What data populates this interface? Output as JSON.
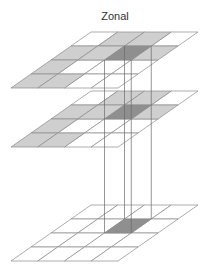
{
  "title": "Zonal",
  "colors": {
    "white": "#ffffff",
    "gray": "#cfcfcf",
    "dark": "#8f8f8f",
    "grid_line": "#8a8a8a",
    "connector_line": "#6a6a6a"
  },
  "geometry": {
    "cols": 4,
    "rows": 4,
    "col_width": 26.75,
    "row_height": 14,
    "row_shear": -20
  },
  "layers": [
    {
      "name": "input-layer-top",
      "origin": [
        91,
        32
      ],
      "cells": [
        [
          "white",
          "gray",
          "gray",
          "white"
        ],
        [
          "gray",
          "gray",
          "dark",
          "gray"
        ],
        [
          "gray",
          "white",
          "white",
          "white"
        ],
        [
          "gray",
          "gray",
          "white",
          "white"
        ]
      ]
    },
    {
      "name": "zone-layer-middle",
      "origin": [
        91,
        91
      ],
      "cells": [
        [
          "white",
          "gray",
          "gray",
          "white"
        ],
        [
          "gray",
          "gray",
          "dark",
          "gray"
        ],
        [
          "gray",
          "white",
          "white",
          "white"
        ],
        [
          "gray",
          "gray",
          "white",
          "white"
        ]
      ]
    },
    {
      "name": "output-layer-bottom",
      "origin": [
        91,
        205
      ],
      "cells": [
        [
          "white",
          "white",
          "white",
          "white"
        ],
        [
          "white",
          "white",
          "dark",
          "white"
        ],
        [
          "white",
          "white",
          "white",
          "white"
        ],
        [
          "white",
          "white",
          "white",
          "white"
        ]
      ]
    }
  ],
  "connectors": {
    "from_layer": 0,
    "to_layer": 2,
    "cell": [
      1,
      2
    ]
  }
}
